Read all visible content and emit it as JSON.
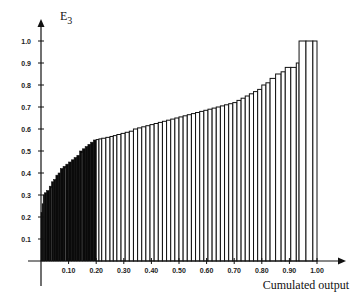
{
  "chart_data": {
    "type": "bar",
    "subtype": "cumulative-width step bar chart",
    "title": "",
    "ylabel": "E3",
    "ylabel_main": "E",
    "ylabel_sub": "3",
    "xlabel": "Cumulated output",
    "xlim": [
      0,
      1.0
    ],
    "ylim": [
      0,
      1.0
    ],
    "x_ticks": [
      "0.10",
      "0.20",
      "0.30",
      "0.40",
      "0.50",
      "0.60",
      "0.70",
      "0.80",
      "0.90",
      "1.00"
    ],
    "y_ticks": [
      "0.1",
      "0.2",
      "0.3",
      "0.4",
      "0.5",
      "0.6",
      "0.7",
      "0.8",
      "0.9",
      "1.0"
    ],
    "grid": false,
    "legend": null,
    "profile": {
      "x": [
        0.0,
        0.01,
        0.03,
        0.05,
        0.08,
        0.1,
        0.13,
        0.15,
        0.18,
        0.2,
        0.25,
        0.3,
        0.35,
        0.4,
        0.45,
        0.5,
        0.55,
        0.6,
        0.65,
        0.7,
        0.75,
        0.78,
        0.8,
        0.83,
        0.85,
        0.88,
        0.9,
        0.93,
        0.94,
        1.0
      ],
      "y": [
        0.22,
        0.3,
        0.32,
        0.36,
        0.42,
        0.44,
        0.47,
        0.5,
        0.53,
        0.55,
        0.56,
        0.58,
        0.6,
        0.62,
        0.635,
        0.65,
        0.665,
        0.68,
        0.7,
        0.72,
        0.74,
        0.76,
        0.78,
        0.81,
        0.83,
        0.86,
        0.88,
        0.9,
        1.0,
        1.0
      ]
    },
    "bars": [
      [
        0.0,
        0.004,
        0.22
      ],
      [
        0.004,
        0.008,
        0.26
      ],
      [
        0.008,
        0.012,
        0.3
      ],
      [
        0.012,
        0.02,
        0.31
      ],
      [
        0.02,
        0.03,
        0.32
      ],
      [
        0.03,
        0.038,
        0.34
      ],
      [
        0.038,
        0.046,
        0.36
      ],
      [
        0.046,
        0.054,
        0.37
      ],
      [
        0.054,
        0.062,
        0.39
      ],
      [
        0.062,
        0.07,
        0.4
      ],
      [
        0.07,
        0.08,
        0.42
      ],
      [
        0.08,
        0.09,
        0.43
      ],
      [
        0.09,
        0.1,
        0.44
      ],
      [
        0.1,
        0.11,
        0.45
      ],
      [
        0.11,
        0.12,
        0.46
      ],
      [
        0.12,
        0.13,
        0.47
      ],
      [
        0.13,
        0.14,
        0.48
      ],
      [
        0.14,
        0.15,
        0.5
      ],
      [
        0.15,
        0.16,
        0.51
      ],
      [
        0.16,
        0.17,
        0.52
      ],
      [
        0.17,
        0.18,
        0.53
      ],
      [
        0.18,
        0.19,
        0.54
      ],
      [
        0.19,
        0.2,
        0.55
      ],
      [
        0.2,
        0.21,
        0.552
      ],
      [
        0.21,
        0.22,
        0.555
      ],
      [
        0.22,
        0.235,
        0.558
      ],
      [
        0.235,
        0.25,
        0.562
      ],
      [
        0.25,
        0.262,
        0.566
      ],
      [
        0.262,
        0.275,
        0.57
      ],
      [
        0.275,
        0.29,
        0.575
      ],
      [
        0.29,
        0.305,
        0.58
      ],
      [
        0.305,
        0.32,
        0.585
      ],
      [
        0.32,
        0.335,
        0.59
      ],
      [
        0.335,
        0.35,
        0.6
      ],
      [
        0.35,
        0.365,
        0.605
      ],
      [
        0.365,
        0.38,
        0.61
      ],
      [
        0.38,
        0.395,
        0.615
      ],
      [
        0.395,
        0.41,
        0.62
      ],
      [
        0.41,
        0.425,
        0.625
      ],
      [
        0.425,
        0.44,
        0.63
      ],
      [
        0.44,
        0.455,
        0.635
      ],
      [
        0.455,
        0.47,
        0.64
      ],
      [
        0.47,
        0.485,
        0.645
      ],
      [
        0.485,
        0.5,
        0.65
      ],
      [
        0.5,
        0.515,
        0.655
      ],
      [
        0.515,
        0.53,
        0.66
      ],
      [
        0.53,
        0.545,
        0.665
      ],
      [
        0.545,
        0.56,
        0.67
      ],
      [
        0.56,
        0.575,
        0.675
      ],
      [
        0.575,
        0.59,
        0.68
      ],
      [
        0.59,
        0.605,
        0.685
      ],
      [
        0.605,
        0.62,
        0.69
      ],
      [
        0.62,
        0.635,
        0.695
      ],
      [
        0.635,
        0.65,
        0.7
      ],
      [
        0.65,
        0.665,
        0.705
      ],
      [
        0.665,
        0.68,
        0.71
      ],
      [
        0.68,
        0.695,
        0.715
      ],
      [
        0.695,
        0.71,
        0.72
      ],
      [
        0.71,
        0.725,
        0.73
      ],
      [
        0.725,
        0.74,
        0.74
      ],
      [
        0.74,
        0.755,
        0.75
      ],
      [
        0.755,
        0.77,
        0.76
      ],
      [
        0.77,
        0.785,
        0.77
      ],
      [
        0.785,
        0.8,
        0.78
      ],
      [
        0.8,
        0.815,
        0.8
      ],
      [
        0.815,
        0.83,
        0.81
      ],
      [
        0.83,
        0.85,
        0.83
      ],
      [
        0.85,
        0.87,
        0.85
      ],
      [
        0.87,
        0.885,
        0.86
      ],
      [
        0.885,
        0.905,
        0.88
      ],
      [
        0.905,
        0.925,
        0.88
      ],
      [
        0.925,
        0.935,
        0.9
      ],
      [
        0.935,
        0.96,
        1.0
      ],
      [
        0.96,
        0.985,
        1.0
      ],
      [
        0.985,
        1.0,
        1.0
      ]
    ],
    "dense_fill_until": 0.2,
    "colors": {
      "axis": "#111111",
      "bar_stroke": "#111111",
      "bar_fill": "#ffffff",
      "dense_fill": "#0a0a0a"
    }
  }
}
